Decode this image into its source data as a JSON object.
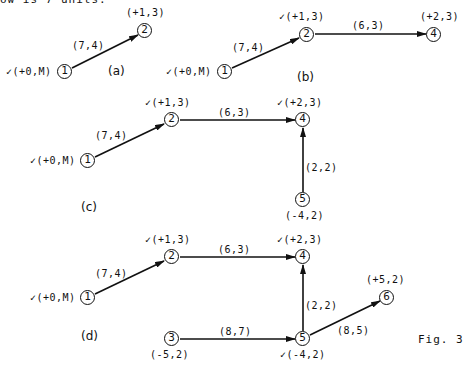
{
  "header_fragment": "ow is 7 units.",
  "figure_caption": "Fig. 3",
  "panels": {
    "a": {
      "label": "(a)",
      "nodes": {
        "n1": "1",
        "n2": "2"
      },
      "node_labels": {
        "n1": "✓(+0,M)",
        "n2": "(+1,3)"
      },
      "edges": [
        {
          "from": "1",
          "to": "2",
          "label": "(7,4)"
        }
      ]
    },
    "b": {
      "label": "(b)",
      "nodes": {
        "n1": "1",
        "n2": "2",
        "n4": "4"
      },
      "node_labels": {
        "n1": "✓(+0,M)",
        "n2": "✓(+1,3)",
        "n4": "(+2,3)"
      },
      "edges": [
        {
          "from": "1",
          "to": "2",
          "label": "(7,4)"
        },
        {
          "from": "2",
          "to": "4",
          "label": "(6,3)"
        }
      ]
    },
    "c": {
      "label": "(c)",
      "nodes": {
        "n1": "1",
        "n2": "2",
        "n4": "4",
        "n5": "5"
      },
      "node_labels": {
        "n1": "✓(+0,M)",
        "n2": "✓(+1,3)",
        "n4": "✓(+2,3)",
        "n5": "(-4,2)"
      },
      "edges": [
        {
          "from": "1",
          "to": "2",
          "label": "(7,4)"
        },
        {
          "from": "2",
          "to": "4",
          "label": "(6,3)"
        },
        {
          "from": "5",
          "to": "4",
          "label": "(2,2)"
        }
      ]
    },
    "d": {
      "label": "(d)",
      "nodes": {
        "n1": "1",
        "n2": "2",
        "n3": "3",
        "n4": "4",
        "n5": "5",
        "n6": "6"
      },
      "node_labels": {
        "n1": "✓(+0,M)",
        "n2": "✓(+1,3)",
        "n3": "(-5,2)",
        "n4": "✓(+2,3)",
        "n5": "✓(-4,2)",
        "n6": "(+5,2)"
      },
      "edges": [
        {
          "from": "1",
          "to": "2",
          "label": "(7,4)"
        },
        {
          "from": "2",
          "to": "4",
          "label": "(6,3)"
        },
        {
          "from": "5",
          "to": "4",
          "label": "(2,2)"
        },
        {
          "from": "3",
          "to": "5",
          "label": "(8,7)"
        },
        {
          "from": "5",
          "to": "6",
          "label": "(8,5)"
        }
      ]
    }
  }
}
